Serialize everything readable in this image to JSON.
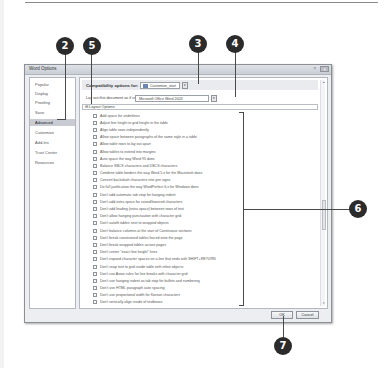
{
  "dialog": {
    "title": "Word Options",
    "title_buttons": [
      "?",
      "X"
    ]
  },
  "nav": {
    "items": [
      {
        "label": "Popular",
        "active": false
      },
      {
        "label": "Display",
        "active": false
      },
      {
        "label": "Proofing",
        "active": false
      },
      {
        "label": "Save",
        "active": false
      },
      {
        "label": "Advanced",
        "active": true
      },
      {
        "label": "Customize",
        "active": false
      },
      {
        "label": "Add-Ins",
        "active": false
      },
      {
        "label": "Trust Center",
        "active": false
      },
      {
        "label": "Resources",
        "active": false
      }
    ]
  },
  "panel": {
    "compat_label": "Compatibility options for:",
    "compat_document": "Customize_start",
    "layout_as_label": "Lay out this document as if created in:",
    "layout_as_value": "Microsoft Office Word 2003",
    "layout_options_header": "Layout Options",
    "options": [
      "Add space for underlines",
      "Adjust line height to grid height in the table",
      "Align table rows independently",
      "Allow space between paragraphs of the same style in a table",
      "Allow table rows to lay out apart",
      "Allow tables to extend into margins",
      "Auto space the way Word 95 does",
      "Balance SBCS characters and DBCS characters",
      "Combine table borders the way Word 5.x for the Macintosh does",
      "Convert backslash characters into yen signs",
      "Do full justification the way WordPerfect 6.x for Windows does",
      "Don't add automatic tab stop for hanging indent",
      "Don't add extra space for raised/lowered characters",
      "Don't add leading (extra space) between rows of text",
      "Don't allow hanging punctuation with character grid",
      "Don't autofit tables next to wrapped objects",
      "Don't balance columns at the start of Continuous sections",
      "Don't break constrained tables forced onto the page",
      "Don't break wrapped tables across pages",
      "Don't center \"exact line height\" lines",
      "Don't expand character spaces on a line that ends with SHIFT+RETURN",
      "Don't snap text to grid inside table with inline objects",
      "Don't use Asian rules for line breaks with character grid",
      "Don't use hanging indent as tab stop for bullets and numbering",
      "Don't use HTML paragraph auto spacing",
      "Don't use proportional width for Korean characters",
      "Don't vertically align inside of textboxes"
    ]
  },
  "buttons": {
    "ok": "OK",
    "cancel": "Cancel"
  },
  "callouts": {
    "c2": "2",
    "c3": "3",
    "c4": "4",
    "c5": "5",
    "c6": "6",
    "c7": "7"
  },
  "icons": {
    "dropdown": "▾",
    "scroll_up": "▴",
    "scroll_down": "▾",
    "collapse": "⊟"
  }
}
